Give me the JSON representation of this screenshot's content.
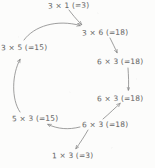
{
  "diagram": {
    "style": "hand-drawn pencil sketch",
    "ink_color": "#6b6b6b",
    "background_color": "#fcfcfb",
    "nodes": [
      {
        "id": "top",
        "label": "3 × 1 (=3)"
      },
      {
        "id": "upright",
        "label": "3 × 6 (=18)"
      },
      {
        "id": "right1",
        "label": "6 × 3 (=18)"
      },
      {
        "id": "right2",
        "label": "6 × 3 (=18)"
      },
      {
        "id": "right3",
        "label": "6 × 3 (=18)"
      },
      {
        "id": "bottom",
        "label": "1 × 3 (=3)"
      },
      {
        "id": "lowleft",
        "label": "5 × 3 (=15)"
      },
      {
        "id": "upleft",
        "label": "3 × 5 (=15)"
      }
    ],
    "edges": [
      {
        "from": "top",
        "to": "upright"
      },
      {
        "from": "upleft",
        "to": "upright"
      },
      {
        "from": "upright",
        "to": "right1"
      },
      {
        "from": "right1",
        "to": "right2"
      },
      {
        "from": "right3",
        "to": "right2"
      },
      {
        "from": "right3",
        "to": "lowleft"
      },
      {
        "from": "right3",
        "to": "bottom"
      },
      {
        "from": "lowleft",
        "to": "upleft"
      }
    ]
  }
}
